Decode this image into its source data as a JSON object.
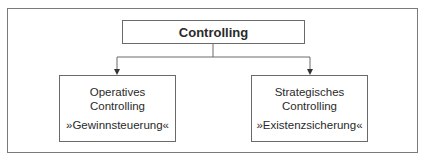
{
  "root": {
    "label": "Controlling"
  },
  "children": [
    {
      "title_line1": "Operatives",
      "title_line2": "Controlling",
      "subtitle": "»Gewinnsteuerung«"
    },
    {
      "title_line1": "Strategisches",
      "title_line2": "Controlling",
      "subtitle": "»Existenzsicherung«"
    }
  ],
  "colors": {
    "line": "#6a6a6a",
    "text": "#2a2a2a",
    "background": "#ffffff"
  }
}
